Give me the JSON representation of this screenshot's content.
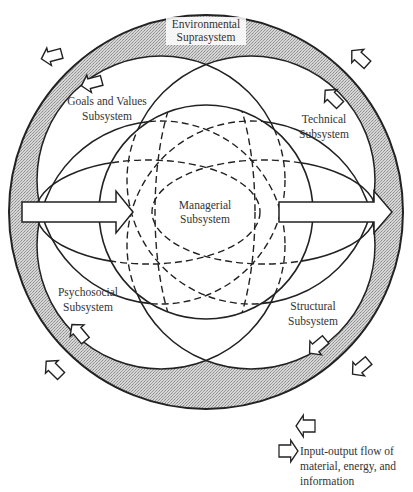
{
  "diagram": {
    "type": "organizational-systems-model",
    "environment": {
      "line1": "Environmental",
      "line2": "Suprasystem"
    },
    "subsystems": {
      "goals": {
        "line1": "Goals and Values",
        "line2": "Subsystem"
      },
      "technical": {
        "line1": "Technical",
        "line2": "Subsystem"
      },
      "managerial": {
        "line1": "Managerial",
        "line2": "Subsystem"
      },
      "psychosocial": {
        "line1": "Psychosocial",
        "line2": "Subsystem"
      },
      "structural": {
        "line1": "Structural",
        "line2": "Subsystem"
      }
    },
    "legend": {
      "line1": "Input-output flow of",
      "line2": "material, energy, and",
      "line3": "information"
    },
    "colors": {
      "stroke": "#222222",
      "band_fill": "#c8c8c8",
      "text": "#333333"
    }
  }
}
